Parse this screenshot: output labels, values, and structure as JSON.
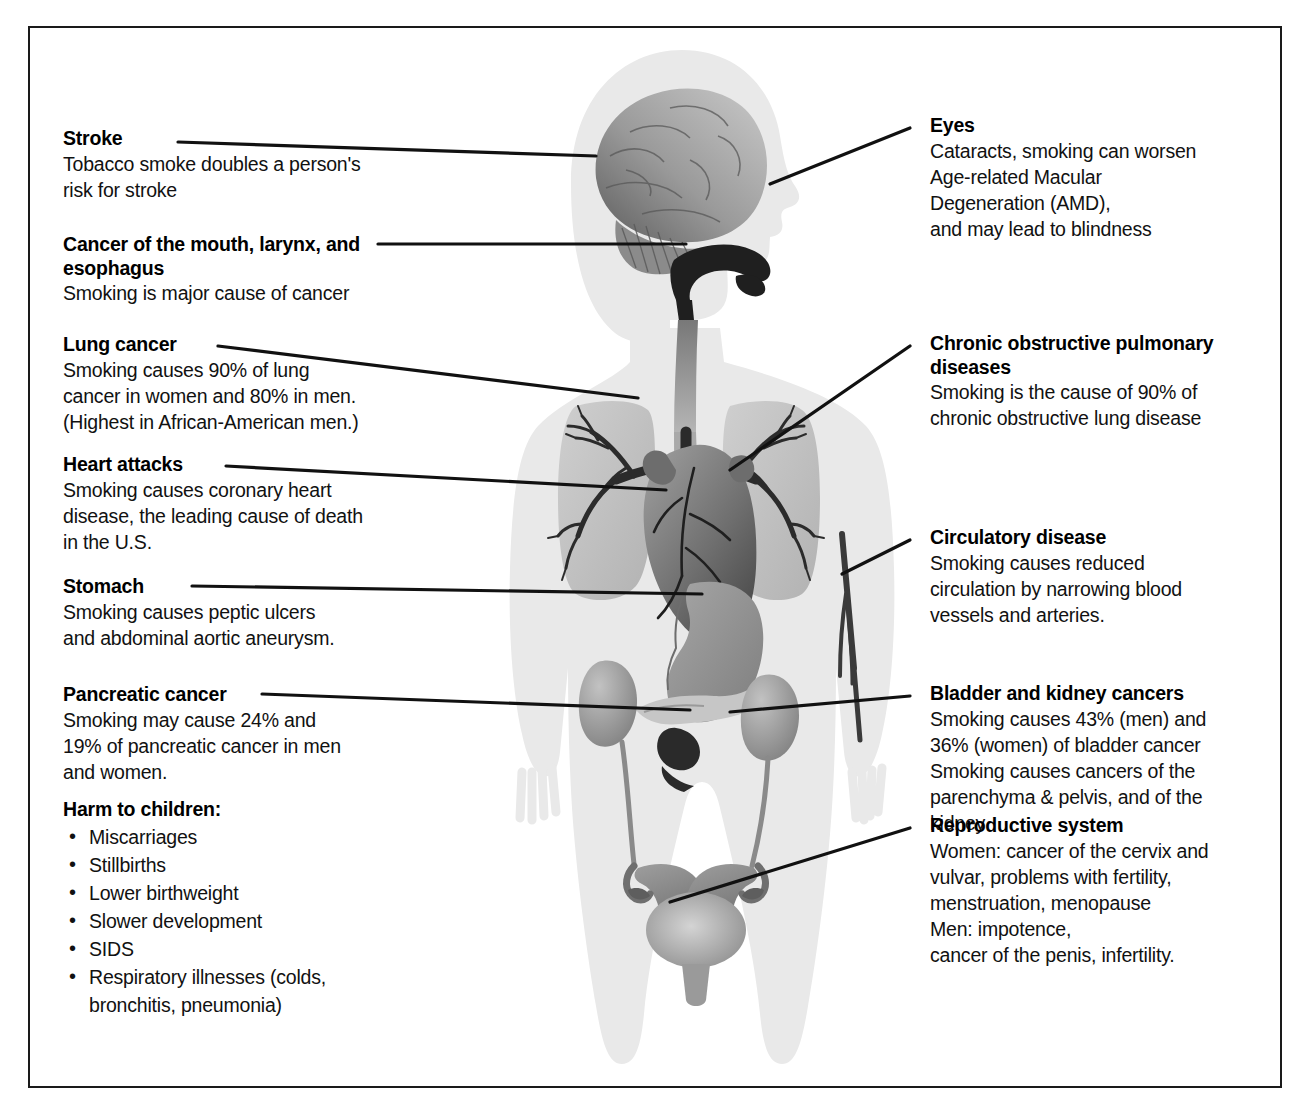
{
  "diagram": {
    "border_color": "#1a1a1a",
    "body_color": "#e9e9e9",
    "organ_dark": "#4a4a4a",
    "organ_mid": "#8e8e8e",
    "organ_light": "#bdbdbd"
  },
  "left_callouts": [
    {
      "id": "stroke",
      "heading": "Stroke",
      "body": "Tobacco smoke doubles a person's\nrisk for stroke"
    },
    {
      "id": "mouth-larynx-esophagus",
      "heading": "Cancer of the mouth, larynx,\nand esophagus",
      "body": "Smoking is major cause of cancer"
    },
    {
      "id": "lung-cancer",
      "heading": "Lung cancer",
      "body": "Smoking causes 90% of lung\ncancer in women and 80% in men.\n(Highest in African-American men.)"
    },
    {
      "id": "heart-attacks",
      "heading": "Heart attacks",
      "body": "Smoking causes coronary heart\ndisease, the leading cause of death\nin the U.S."
    },
    {
      "id": "stomach",
      "heading": "Stomach",
      "body": "Smoking causes peptic ulcers\nand abdominal aortic aneurysm."
    },
    {
      "id": "pancreatic-cancer",
      "heading": "Pancreatic cancer",
      "body": "Smoking may cause 24% and\n19% of pancreatic cancer in men\nand women."
    }
  ],
  "harm_to_children": {
    "heading": "Harm to children:",
    "items": [
      "Miscarriages",
      "Stillbirths",
      "Lower birthweight",
      "Slower development",
      "SIDS",
      "Respiratory illnesses (colds,\nbronchitis, pneumonia)"
    ]
  },
  "right_callouts": [
    {
      "id": "eyes",
      "heading": "Eyes",
      "body": "Cataracts, smoking can worsen\nAge-related Macular\nDegeneration (AMD),\nand may lead to blindness"
    },
    {
      "id": "copd",
      "heading": "Chronic obstructive\npulmonary diseases",
      "body": "Smoking is the cause of 90% of\nchronic obstructive lung disease"
    },
    {
      "id": "circulatory-disease",
      "heading": "Circulatory disease",
      "body": "Smoking causes reduced\ncirculation by narrowing blood\nvessels and arteries."
    },
    {
      "id": "bladder-kidney-cancers",
      "heading": "Bladder and kidney cancers",
      "body": "Smoking causes 43% (men) and\n36% (women) of bladder cancer\nSmoking causes cancers of the\nparenchyma & pelvis, and of the\nkidney"
    },
    {
      "id": "reproductive-system",
      "heading": "Reproductive system",
      "body": "Women: cancer of the cervix and\nvulvar, problems with fertility,\nmenstruation, menopause\nMen: impotence,\ncancer of the penis, infertility."
    }
  ]
}
